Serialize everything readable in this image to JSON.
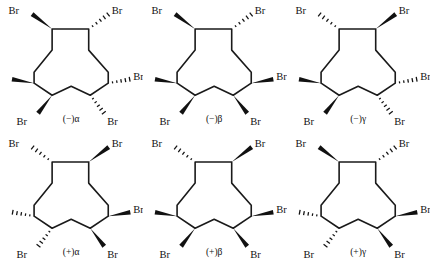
{
  "figure": {
    "type": "chemical-structure-grid",
    "rows": 2,
    "columns": 3,
    "background_color": "#ffffff",
    "bond_color": "#1a1a1a",
    "substituent_label": "Br",
    "ring_size": 12
  },
  "structures": [
    {
      "id": "minus-alpha",
      "label": "(−)α",
      "substituents": [
        {
          "position": "top-left",
          "label": "Br",
          "bond": "wedge"
        },
        {
          "position": "top-right",
          "label": "Br",
          "bond": "hash"
        },
        {
          "position": "middle-left",
          "label": "Br",
          "bond": "wedge"
        },
        {
          "position": "middle-right",
          "label": "Br",
          "bond": "hash"
        },
        {
          "position": "bottom-left",
          "label": "Br",
          "bond": "wedge"
        },
        {
          "position": "bottom-right",
          "label": "Br",
          "bond": "hash"
        }
      ]
    },
    {
      "id": "minus-beta",
      "label": "(−)β",
      "substituents": [
        {
          "position": "top-left",
          "label": "Br",
          "bond": "wedge"
        },
        {
          "position": "top-right",
          "label": "Br",
          "bond": "hash"
        },
        {
          "position": "middle-left",
          "label": "Br",
          "bond": "wedge"
        },
        {
          "position": "middle-right",
          "label": "Br",
          "bond": "wedge"
        },
        {
          "position": "bottom-left",
          "label": "Br",
          "bond": "wedge"
        },
        {
          "position": "bottom-right",
          "label": "Br",
          "bond": "wedge"
        }
      ]
    },
    {
      "id": "minus-gamma",
      "label": "(−)γ",
      "substituents": [
        {
          "position": "top-left",
          "label": "Br",
          "bond": "hash"
        },
        {
          "position": "top-right",
          "label": "Br",
          "bond": "wedge"
        },
        {
          "position": "middle-left",
          "label": "Br",
          "bond": "wedge"
        },
        {
          "position": "middle-right",
          "label": "Br",
          "bond": "hash"
        },
        {
          "position": "bottom-left",
          "label": "Br",
          "bond": "wedge"
        },
        {
          "position": "bottom-right",
          "label": "Br",
          "bond": "hash"
        }
      ]
    },
    {
      "id": "plus-alpha",
      "label": "(+)α",
      "substituents": [
        {
          "position": "top-left",
          "label": "Br",
          "bond": "hash"
        },
        {
          "position": "top-right",
          "label": "Br",
          "bond": "wedge"
        },
        {
          "position": "middle-left",
          "label": "Br",
          "bond": "hash"
        },
        {
          "position": "middle-right",
          "label": "Br",
          "bond": "wedge"
        },
        {
          "position": "bottom-left",
          "label": "Br",
          "bond": "hash"
        },
        {
          "position": "bottom-right",
          "label": "Br",
          "bond": "wedge"
        }
      ]
    },
    {
      "id": "plus-beta",
      "label": "(+)β",
      "substituents": [
        {
          "position": "top-left",
          "label": "Br",
          "bond": "hash"
        },
        {
          "position": "top-right",
          "label": "Br",
          "bond": "wedge"
        },
        {
          "position": "middle-left",
          "label": "Br",
          "bond": "wedge"
        },
        {
          "position": "middle-right",
          "label": "Br",
          "bond": "wedge"
        },
        {
          "position": "bottom-left",
          "label": "Br",
          "bond": "wedge"
        },
        {
          "position": "bottom-right",
          "label": "Br",
          "bond": "wedge"
        }
      ]
    },
    {
      "id": "plus-gamma",
      "label": "(+)γ",
      "substituents": [
        {
          "position": "top-left",
          "label": "Br",
          "bond": "wedge"
        },
        {
          "position": "top-right",
          "label": "Br",
          "bond": "hash"
        },
        {
          "position": "middle-left",
          "label": "Br",
          "bond": "hash"
        },
        {
          "position": "middle-right",
          "label": "Br",
          "bond": "wedge"
        },
        {
          "position": "bottom-left",
          "label": "Br",
          "bond": "hash"
        },
        {
          "position": "bottom-right",
          "label": "Br",
          "bond": "wedge"
        }
      ]
    }
  ]
}
